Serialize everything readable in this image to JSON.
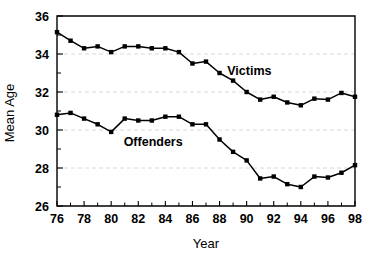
{
  "chart_data": {
    "type": "line",
    "title": "",
    "xlabel": "Year",
    "ylabel": "Mean Age",
    "xlim": [
      76,
      98
    ],
    "ylim": [
      26,
      36
    ],
    "grid": true,
    "grid_axis": "y",
    "legend_position": "inline-annotation",
    "x": [
      76,
      77,
      78,
      79,
      80,
      81,
      82,
      83,
      84,
      85,
      86,
      87,
      88,
      89,
      90,
      91,
      92,
      93,
      94,
      95,
      96,
      97,
      98
    ],
    "x_tick_labels": [
      "76",
      "",
      "78",
      "",
      "80",
      "",
      "82",
      "",
      "84",
      "",
      "86",
      "",
      "88",
      "",
      "90",
      "",
      "92",
      "",
      "94",
      "",
      "96",
      "",
      "98"
    ],
    "x_major_ticks": [
      76,
      78,
      80,
      82,
      84,
      86,
      88,
      90,
      92,
      94,
      96,
      98
    ],
    "x_minor_ticks": [
      77,
      79,
      81,
      83,
      85,
      87,
      89,
      91,
      93,
      95,
      97
    ],
    "y_major_ticks": [
      26,
      28,
      30,
      32,
      34,
      36
    ],
    "y_minor_ticks": [
      27,
      29,
      31,
      33,
      35
    ],
    "y_tick_labels": [
      "26",
      "28",
      "30",
      "32",
      "34",
      "36"
    ],
    "series": [
      {
        "name": "Victims",
        "label": "Victims",
        "color": "#000000",
        "marker": "square",
        "annotation_x": 90.2,
        "annotation_y": 32.9,
        "values": [
          35.15,
          34.7,
          34.3,
          34.4,
          34.1,
          34.4,
          34.4,
          34.3,
          34.3,
          34.1,
          33.5,
          33.6,
          33.0,
          32.6,
          32.0,
          31.6,
          31.75,
          31.45,
          31.3,
          31.65,
          31.6,
          31.95,
          31.75
        ]
      },
      {
        "name": "Offenders",
        "label": "Offenders",
        "color": "#000000",
        "marker": "square",
        "annotation_x": 83.1,
        "annotation_y": 29.15,
        "values": [
          30.8,
          30.9,
          30.6,
          30.3,
          29.9,
          30.6,
          30.5,
          30.5,
          30.7,
          30.7,
          30.3,
          30.3,
          29.5,
          28.85,
          28.4,
          27.45,
          27.55,
          27.15,
          27.0,
          27.55,
          27.5,
          27.75,
          28.15
        ]
      }
    ]
  }
}
